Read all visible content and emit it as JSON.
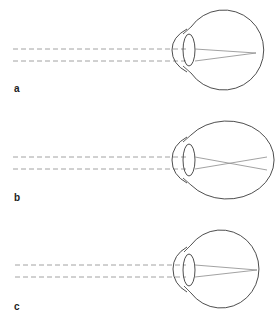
{
  "diagram": {
    "panels": [
      {
        "label": "a",
        "condition": "emmetropia",
        "description": "Parallel rays focus on the retina"
      },
      {
        "label": "b",
        "condition": "myopia",
        "description": "Elongated eye; rays focus in front of the retina"
      },
      {
        "label": "c",
        "condition": "hyperopia",
        "description": "Short eye; rays focus behind the retina"
      }
    ],
    "colors": {
      "outline": "#3a3a3a",
      "rays": "#8a8a8a",
      "dashed": "#8a8a8a",
      "background": "#ffffff"
    }
  }
}
